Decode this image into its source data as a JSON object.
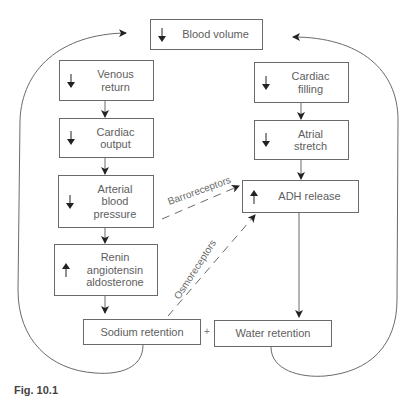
{
  "diagram": {
    "type": "flowchart",
    "nodes": [
      {
        "id": "blood_volume",
        "label": "Blood volume",
        "direction": "down"
      },
      {
        "id": "venous_return",
        "label": "Venous\nreturn",
        "direction": "down"
      },
      {
        "id": "cardiac_output",
        "label": "Cardiac\noutput",
        "direction": "down"
      },
      {
        "id": "arterial_bp",
        "label": "Arterial\nblood\npressure",
        "direction": "down"
      },
      {
        "id": "raa",
        "label": "Renin\nangiotensin\naldosterone",
        "direction": "up"
      },
      {
        "id": "sodium_retention",
        "label": "Sodium retention"
      },
      {
        "id": "water_retention",
        "label": "Water retention"
      },
      {
        "id": "cardiac_filling",
        "label": "Cardiac\nfilling",
        "direction": "down"
      },
      {
        "id": "atrial_stretch",
        "label": "Atrial\nstretch",
        "direction": "down"
      },
      {
        "id": "adh_release",
        "label": "ADH release",
        "direction": "up"
      }
    ],
    "edges": [
      {
        "from": "venous_return",
        "to": "cardiac_output",
        "style": "solid"
      },
      {
        "from": "cardiac_output",
        "to": "arterial_bp",
        "style": "solid"
      },
      {
        "from": "arterial_bp",
        "to": "raa",
        "style": "solid"
      },
      {
        "from": "raa",
        "to": "sodium_retention",
        "style": "solid"
      },
      {
        "from": "cardiac_filling",
        "to": "atrial_stretch",
        "style": "solid"
      },
      {
        "from": "atrial_stretch",
        "to": "adh_release",
        "style": "solid"
      },
      {
        "from": "adh_release",
        "to": "water_retention",
        "style": "solid"
      },
      {
        "from": "arterial_bp",
        "to": "adh_release",
        "style": "dashed",
        "label": "Barroreceptors"
      },
      {
        "from": "sodium_retention",
        "to": "adh_release",
        "style": "dashed",
        "label": "Osmoreceptors"
      },
      {
        "from": "sodium_retention",
        "to": "blood_volume",
        "style": "curved"
      },
      {
        "from": "water_retention",
        "to": "blood_volume",
        "style": "curved"
      }
    ],
    "plus_sign": "+",
    "caption": "Fig. 10.1"
  },
  "colors": {
    "line": "#6a6a6a",
    "text": "#5e5e5e",
    "background": "#ffffff"
  }
}
